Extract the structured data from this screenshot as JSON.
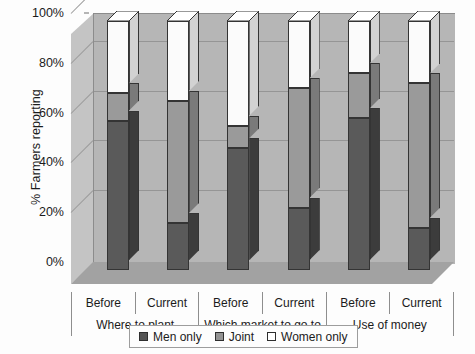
{
  "chart_data": {
    "type": "bar",
    "subtype": "stacked-column-3d",
    "title": "",
    "xlabel": "",
    "ylabel": "% Farmers reporting",
    "ylim": [
      0,
      100
    ],
    "ytick_labels": [
      "0%",
      "20%",
      "40%",
      "60%",
      "80%",
      "100%"
    ],
    "ytick_values": [
      0,
      20,
      40,
      60,
      80,
      100
    ],
    "grid": true,
    "legend_position": "bottom",
    "categories": [
      "Before",
      "Current",
      "Before",
      "Current",
      "Before",
      "Current"
    ],
    "groups": [
      {
        "label": "Where to plant",
        "categories": [
          "Before",
          "Current"
        ]
      },
      {
        "label": "Which market to go to",
        "categories": [
          "Before",
          "Current"
        ]
      },
      {
        "label": "Use of money",
        "categories": [
          "Before",
          "Current"
        ]
      }
    ],
    "series": [
      {
        "name": "Men only",
        "color": "#5a5a5a",
        "values": [
          60,
          19,
          49,
          25,
          61,
          17
        ]
      },
      {
        "name": "Joint",
        "color": "#9a9a9a",
        "values": [
          11,
          49,
          9,
          48,
          18,
          58
        ]
      },
      {
        "name": "Women only",
        "color": "#fbfbfb",
        "values": [
          29,
          32,
          42,
          27,
          21,
          25
        ]
      }
    ]
  },
  "axis": {
    "y_title": "% Farmers reporting",
    "y_ticks": [
      {
        "label": "100%",
        "value": 100
      },
      {
        "label": "80%",
        "value": 80
      },
      {
        "label": "60%",
        "value": 60
      },
      {
        "label": "40%",
        "value": 40
      },
      {
        "label": "20%",
        "value": 20
      },
      {
        "label": "0%",
        "value": 0
      }
    ]
  },
  "category_axis": {
    "row1": [
      "Before",
      "Current",
      "Before",
      "Current",
      "Before",
      "Current"
    ],
    "row2": [
      "Where to plant",
      "Which market to go to",
      "Use of money"
    ]
  },
  "legend": {
    "items": [
      {
        "label": "Men only",
        "swatch": "men-only-swatch"
      },
      {
        "label": "Joint",
        "swatch": "joint-swatch"
      },
      {
        "label": "Women only",
        "swatch": "women-only-swatch"
      }
    ]
  },
  "colors": {
    "men_only": "#5a5a5a",
    "joint": "#9a9a9a",
    "women_only": "#fbfbfb",
    "back_wall": "#b6b6b6",
    "side_wall": "#c4c4c4",
    "floor": "#a2a2a2"
  }
}
